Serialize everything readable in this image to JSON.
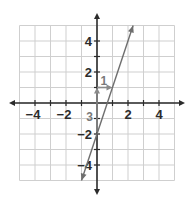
{
  "graph": {
    "x_range": [
      -5,
      5
    ],
    "y_range": [
      -5,
      5
    ],
    "grid_step": 1,
    "x_tick_labels": [
      "-4",
      "-2",
      "2",
      "4"
    ],
    "x_tick_values": [
      -4,
      -2,
      2,
      4
    ],
    "y_tick_labels": [
      "4",
      "2",
      "-2",
      "-4"
    ],
    "y_tick_values": [
      4,
      2,
      -2,
      -4
    ],
    "line": {
      "equation": "y = 3x - 2",
      "slope": 3,
      "intercept": -2,
      "from": [
        -1,
        -5
      ],
      "to": [
        2.33,
        5
      ]
    },
    "slope_triangle": {
      "rise_label": "3",
      "run_label": "1",
      "start": [
        0,
        -2
      ],
      "corner": [
        0,
        1
      ],
      "end": [
        1,
        1
      ]
    },
    "colors": {
      "grid": "#cfcfcf",
      "axes": "#2b2b2b",
      "line": "#6e6e6e",
      "annotation": "#8a8a8a"
    }
  }
}
